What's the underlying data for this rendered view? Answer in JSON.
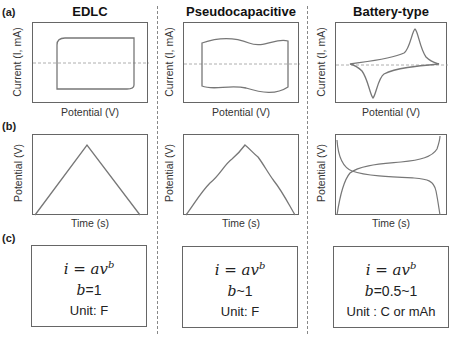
{
  "panel_labels": {
    "a": "(a)",
    "b": "(b)",
    "c": "(c)"
  },
  "columns": [
    {
      "title": "EDLC",
      "cv": {
        "xlabel": "Potential (V)",
        "ylabel": "Current (I, mA)",
        "shape": "rectangular"
      },
      "gcd": {
        "xlabel": "Time (s)",
        "ylabel": "Potential (V)",
        "shape": "linear triangle"
      },
      "box": {
        "equation": "i = av",
        "exponent": "b",
        "b_var": "b",
        "b_value": "=1",
        "unit": "Unit: F"
      }
    },
    {
      "title": "Pseudocapacitive",
      "cv": {
        "xlabel": "Potential (V)",
        "ylabel": "Current (I, mA)",
        "shape": "quasi-rectangular wavy"
      },
      "gcd": {
        "xlabel": "Time (s)",
        "ylabel": "Potential (V)",
        "shape": "quasi-triangle"
      },
      "box": {
        "equation": "i = av",
        "exponent": "b",
        "b_var": "b",
        "b_value": "~1",
        "unit": "Unit: F"
      }
    },
    {
      "title": "Battery-type",
      "cv": {
        "xlabel": "Potential (V)",
        "ylabel": "Current (I, mA)",
        "shape": "redox peaks"
      },
      "gcd": {
        "xlabel": "Time (s)",
        "ylabel": "Potential (V)",
        "shape": "voltage plateaus"
      },
      "box": {
        "equation": "i = av",
        "exponent": "b",
        "b_var": "b",
        "b_value": "=0.5~1",
        "unit": "Unit : C or mAh"
      }
    }
  ],
  "colors": {
    "curve": "#777777",
    "frame": "#666666",
    "zero_line": "#999999",
    "divider": "#888888"
  }
}
